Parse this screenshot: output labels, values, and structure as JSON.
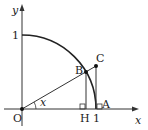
{
  "diagram": {
    "type": "unit-circle-trig",
    "axes": {
      "x_label": "x",
      "y_label": "y"
    },
    "ticks": {
      "x_one": "1",
      "y_one": "1"
    },
    "points": {
      "origin": "O",
      "B": "B",
      "C": "C",
      "H": "H",
      "A": "A"
    },
    "angle_label": "x",
    "colors": {
      "stroke": "#222222",
      "background": "#ffffff"
    }
  }
}
